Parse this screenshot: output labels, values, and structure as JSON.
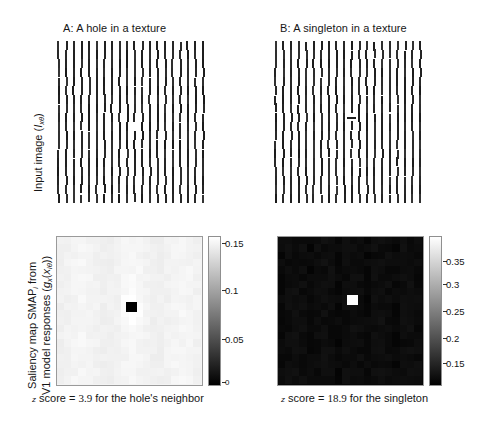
{
  "figure": {
    "background": "#ffffff",
    "width": 486,
    "height": 430
  },
  "panels": {
    "a": {
      "title": "A: A hole in a texture",
      "caption_prefix": "z",
      "caption_body": " score = ",
      "caption_value": "3.9",
      "caption_suffix": " for the hole's neighbor"
    },
    "b": {
      "title": "B: A singleton in a texture",
      "caption_prefix": "z",
      "caption_body": " score = ",
      "caption_value": "18.9",
      "caption_suffix": " for the singleton"
    }
  },
  "axes": {
    "row1_ylabel_main": "Input image (",
    "row1_ylabel_symbol": "I",
    "row1_ylabel_sub": "xθ",
    "row1_ylabel_close": ")",
    "row2_ylabel_line1": "Saliency map SMAP",
    "row2_ylabel_line1_sub": "i",
    "row2_ylabel_line1_tail": " from",
    "row2_ylabel_line2": "V1 model responses (",
    "row2_ylabel_line2_sym": "g",
    "row2_ylabel_line2_sym_sub": "x",
    "row2_ylabel_line2_mid": "(",
    "row2_ylabel_line2_sym2": "x",
    "row2_ylabel_line2_sym2_sub": "iθ",
    "row2_ylabel_line2_close": "))"
  },
  "chart_data": {
    "type": "heatmap",
    "panels": [
      {
        "id": "A",
        "title": "A: A hole in a texture",
        "row1": {
          "type": "texture-stimulus",
          "description": "Grid of vertical bars with one bar missing (a hole) near the centre",
          "bar_orientation": "vertical",
          "grid_cols": 20,
          "grid_rows": 18,
          "anomaly": {
            "type": "missing-bar",
            "col": 10,
            "row": 9
          }
        },
        "row2": {
          "type": "heatmap",
          "colormap": "gray",
          "description": "Saliency map, near-uniform high values with a dark (low saliency) square at the hole location",
          "clim": [
            0,
            0.15
          ],
          "cbar_ticks": [
            0,
            0.05,
            0.1,
            0.15
          ],
          "cbar_tick_labels": [
            "0",
            "0.05",
            "0.1",
            "0.15"
          ],
          "target": {
            "row": 9,
            "col": 10,
            "value": 0.0,
            "appearance": "black square"
          },
          "background_value_approx": 0.14
        },
        "z_score": 3.9,
        "z_score_text": "z score = 3.9 for the hole's neighbor"
      },
      {
        "id": "B",
        "title": "B: A singleton in a texture",
        "row1": {
          "type": "texture-stimulus",
          "description": "Grid of vertical bars with one horizontal bar (a singleton) near the centre",
          "bar_orientation": "vertical",
          "grid_cols": 20,
          "grid_rows": 18,
          "anomaly": {
            "type": "orientation-singleton",
            "col": 10,
            "row": 8,
            "orientation": "horizontal"
          }
        },
        "row2": {
          "type": "heatmap",
          "colormap": "gray",
          "description": "Saliency map, near-uniform low values with a bright (high saliency) square at the singleton location",
          "clim": [
            0.12,
            0.39
          ],
          "cbar_ticks": [
            0.15,
            0.2,
            0.25,
            0.3,
            0.35
          ],
          "cbar_tick_labels": [
            "0.15",
            "0.2",
            "0.25",
            "0.3",
            "0.35"
          ],
          "target": {
            "row": 8,
            "col": 10,
            "value": 0.39,
            "appearance": "white square"
          },
          "background_value_approx": 0.135
        },
        "z_score": 18.9,
        "z_score_text": "z score = 18.9 for the singleton"
      }
    ],
    "ylabel_row1": "Input image (I_xθ)",
    "ylabel_row2": "Saliency map SMAP_i from V1 model responses (g_x(x_iθ))",
    "grid": false,
    "legend": "none"
  },
  "colorbars": {
    "a": {
      "ticks": [
        {
          "label": "0.15",
          "pos_pct": 4
        },
        {
          "label": "0.1",
          "pos_pct": 36
        },
        {
          "label": "0.05",
          "pos_pct": 69
        },
        {
          "label": "0",
          "pos_pct": 98
        }
      ]
    },
    "b": {
      "ticks": [
        {
          "label": "0.35",
          "pos_pct": 16
        },
        {
          "label": "0.3",
          "pos_pct": 32
        },
        {
          "label": "0.25",
          "pos_pct": 50
        },
        {
          "label": "0.2",
          "pos_pct": 68
        },
        {
          "label": "0.15",
          "pos_pct": 85
        }
      ]
    }
  }
}
